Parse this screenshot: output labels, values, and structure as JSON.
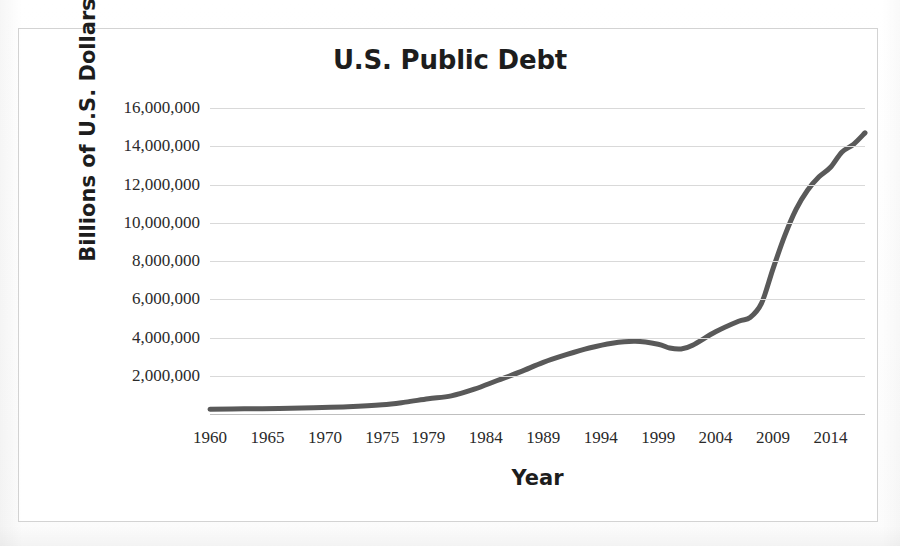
{
  "figure": {
    "title": "U.S. Public Debt",
    "caption_partial": ""
  },
  "chart_data": {
    "type": "line",
    "title": "U.S. Public Debt",
    "xlabel": "Year",
    "ylabel": "Billions of U.S. Dollars",
    "grid": true,
    "legend": "none",
    "line_color": "#595959",
    "line_width_px": 5,
    "xlim": [
      1960,
      2017
    ],
    "ylim": [
      0,
      16000000
    ],
    "ytick_labels": [
      "16,000,000",
      "14,000,000",
      "12,000,000",
      "10,000,000",
      "8,000,000",
      "6,000,000",
      "4,000,000",
      "2,000,000"
    ],
    "ytick_values": [
      16000000,
      14000000,
      12000000,
      10000000,
      8000000,
      6000000,
      4000000,
      2000000
    ],
    "xtick_labels": [
      "1960",
      "1965",
      "1970",
      "1975",
      "1979",
      "1984",
      "1989",
      "1994",
      "1999",
      "2004",
      "2009",
      "2014"
    ],
    "xtick_values": [
      1960,
      1965,
      1970,
      1975,
      1979,
      1984,
      1989,
      1994,
      1999,
      2004,
      2009,
      2014
    ],
    "x": [
      1960,
      1962,
      1964,
      1966,
      1968,
      1970,
      1972,
      1974,
      1976,
      1978,
      1980,
      1982,
      1984,
      1986,
      1988,
      1990,
      1992,
      1994,
      1996,
      1997,
      1998,
      1999,
      2000,
      2001,
      2002,
      2003,
      2004,
      2005,
      2006,
      2007,
      2008,
      2009,
      2010,
      2011,
      2012,
      2013,
      2014,
      2015,
      2016,
      2017
    ],
    "y": [
      290000,
      303000,
      317000,
      329000,
      369000,
      381000,
      437000,
      486000,
      629000,
      777000,
      909000,
      1142000,
      1577000,
      2125000,
      2601000,
      3233000,
      4064000,
      4692000,
      5225000,
      5413000,
      5526000,
      5656000,
      5629000,
      5770000,
      6198000,
      6760000,
      7355000,
      7905000,
      8451000,
      8950000,
      9986000,
      11876000,
      13529000,
      14764000,
      16051000,
      16719000,
      17794000,
      18120000,
      19539000,
      20244000
    ],
    "series": [
      {
        "name": "U.S. Public Debt",
        "values": [
          290000,
          303000,
          317000,
          329000,
          369000,
          381000,
          437000,
          486000,
          629000,
          777000,
          909000,
          1142000,
          1577000,
          2125000,
          2601000,
          3233000,
          4064000,
          4692000,
          5225000,
          5413000,
          5526000,
          5656000,
          5629000,
          5770000,
          6198000,
          6760000,
          7355000,
          7905000,
          8451000,
          8950000,
          9986000,
          11876000,
          13529000,
          14764000,
          16051000,
          16719000,
          17794000,
          18120000,
          19539000,
          20244000
        ]
      }
    ],
    "plotted_points": [
      {
        "x": 1960,
        "y": 250000
      },
      {
        "x": 1963,
        "y": 270000
      },
      {
        "x": 1966,
        "y": 290000
      },
      {
        "x": 1969,
        "y": 330000
      },
      {
        "x": 1972,
        "y": 380000
      },
      {
        "x": 1975,
        "y": 480000
      },
      {
        "x": 1977,
        "y": 620000
      },
      {
        "x": 1979,
        "y": 800000
      },
      {
        "x": 1981,
        "y": 950000
      },
      {
        "x": 1983,
        "y": 1300000
      },
      {
        "x": 1985,
        "y": 1750000
      },
      {
        "x": 1987,
        "y": 2200000
      },
      {
        "x": 1989,
        "y": 2700000
      },
      {
        "x": 1991,
        "y": 3100000
      },
      {
        "x": 1993,
        "y": 3450000
      },
      {
        "x": 1995,
        "y": 3700000
      },
      {
        "x": 1997,
        "y": 3800000
      },
      {
        "x": 1999,
        "y": 3650000
      },
      {
        "x": 2000,
        "y": 3450000
      },
      {
        "x": 2001,
        "y": 3400000
      },
      {
        "x": 2002,
        "y": 3600000
      },
      {
        "x": 2004,
        "y": 4300000
      },
      {
        "x": 2006,
        "y": 4850000
      },
      {
        "x": 2007,
        "y": 5050000
      },
      {
        "x": 2008,
        "y": 5800000
      },
      {
        "x": 2009,
        "y": 7600000
      },
      {
        "x": 2010,
        "y": 9300000
      },
      {
        "x": 2011,
        "y": 10700000
      },
      {
        "x": 2012,
        "y": 11700000
      },
      {
        "x": 2013,
        "y": 12400000
      },
      {
        "x": 2014,
        "y": 12900000
      },
      {
        "x": 2015,
        "y": 13700000
      },
      {
        "x": 2016,
        "y": 14100000
      },
      {
        "x": 2017,
        "y": 14700000
      }
    ],
    "annotations": [
      {
        "label": "local peak",
        "x": 1997,
        "y": 3800000
      },
      {
        "label": "local dip",
        "x": 2001,
        "y": 3400000
      },
      {
        "label": "endpoint",
        "x": 2017,
        "y": 14700000
      }
    ]
  }
}
